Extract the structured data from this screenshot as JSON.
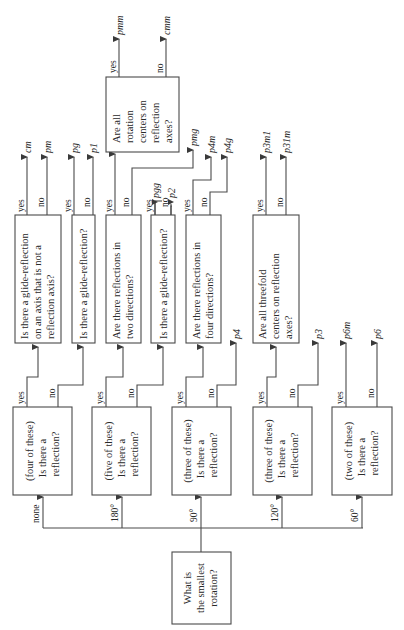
{
  "root": {
    "lines": [
      "What is",
      "the smallest",
      "rotation?"
    ]
  },
  "rotation_branches": [
    {
      "label": "none",
      "box_lines": [
        "(four of these)",
        "Is there a",
        "reflection?"
      ]
    },
    {
      "label": "180°",
      "box_lines": [
        "(five of these)",
        "Is there a",
        "reflection?"
      ]
    },
    {
      "label": "90°",
      "box_lines": [
        "(three of these)",
        "Is there a",
        "reflection?"
      ]
    },
    {
      "label": "120°",
      "box_lines": [
        "(three of these)",
        "Is there a",
        "reflection?"
      ]
    },
    {
      "label": "60°",
      "box_lines": [
        "(two of these)",
        "Is there a",
        "reflection?"
      ]
    }
  ],
  "branch_labels": {
    "yes": "yes",
    "no": "no"
  },
  "level2": {
    "none_yes": {
      "lines": [
        "Is there a glide-reflection",
        "on an axis that is not a",
        "reflection axis?"
      ],
      "yes": "cm",
      "no": "pm"
    },
    "none_no": {
      "lines": [
        "Is there a glide-reflection?"
      ],
      "yes": "pg",
      "no": "p1"
    },
    "r180_yes": {
      "lines": [
        "Are there reflections in",
        "two directions?"
      ],
      "no": "pmg"
    },
    "r180_no": {
      "lines": [
        "Is there a glide-reflection?"
      ],
      "yes": "pgg",
      "no": "p2"
    },
    "r90_yes": {
      "lines": [
        "Are there reflections in",
        "four directions?"
      ],
      "yes": "p4m",
      "no": "p4g"
    },
    "r90_no_result": "p4",
    "r120_yes": {
      "lines": [
        "Are all threefold",
        "centers on reflection",
        "axes?"
      ],
      "yes": "p3m1",
      "no": "p31m"
    },
    "r120_no_result": "p3",
    "r60_yes_result": "p6m",
    "r60_no_result": "p6"
  },
  "level3": {
    "lines": [
      "Are all",
      "rotation",
      "centers on",
      "reflection",
      "axes?"
    ],
    "yes": "pmm",
    "no": "cmm"
  }
}
